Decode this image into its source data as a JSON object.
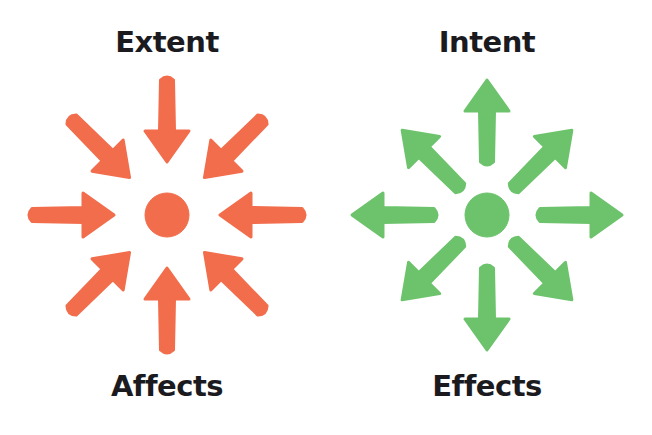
{
  "colors": {
    "inward": "#f26d4c",
    "outward": "#6cc36c",
    "text": "#1b1b1f",
    "background": "#ffffff"
  },
  "left_diagram": {
    "top_label": "Extent",
    "bottom_label": "Affects",
    "direction": "inward",
    "arrow_count": 8,
    "center": [
      167,
      215
    ]
  },
  "right_diagram": {
    "top_label": "Intent",
    "bottom_label": "Effects",
    "direction": "outward",
    "arrow_count": 8,
    "center": [
      487,
      215
    ]
  }
}
